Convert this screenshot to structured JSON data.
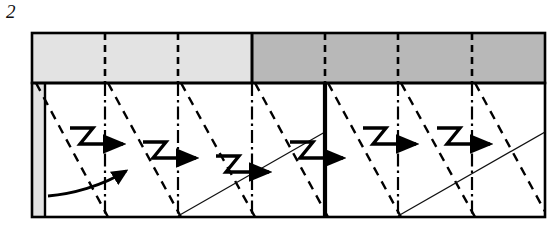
{
  "figure": {
    "label": "2",
    "type": "schematic-diagram"
  },
  "colors": {
    "background": "#ffffff",
    "outline": "#000000",
    "band_light": "#e3e3e3",
    "band_dark": "#b8b8b8",
    "edge_strip": "#e3e3e3",
    "thin_line": "#111111"
  },
  "layout": {
    "frame": {
      "x": 32,
      "y": 33,
      "width": 513,
      "height": 184
    },
    "band": {
      "x": 32,
      "y": 33,
      "width": 513,
      "height": 50
    },
    "field": {
      "x": 32,
      "y": 83,
      "width": 513,
      "height": 134
    },
    "edge_strip": {
      "x": 32,
      "y": 83,
      "width": 13,
      "height": 134
    },
    "band_split_x": 252,
    "thick_divider_x": 325
  },
  "band_segments": [
    {
      "name": "segment-1",
      "x0": 32,
      "x1": 105,
      "shade": "light"
    },
    {
      "name": "segment-2",
      "x0": 105,
      "x1": 178,
      "shade": "light"
    },
    {
      "name": "segment-3",
      "x0": 178,
      "x1": 252,
      "shade": "light"
    },
    {
      "name": "segment-4",
      "x0": 252,
      "x1": 325,
      "shade": "dark"
    },
    {
      "name": "segment-5",
      "x0": 325,
      "x1": 398,
      "shade": "dark"
    },
    {
      "name": "segment-6",
      "x0": 398,
      "x1": 472,
      "shade": "dark"
    },
    {
      "name": "segment-7",
      "x0": 472,
      "x1": 545,
      "shade": "dark"
    }
  ],
  "dash_dot_lines": [
    {
      "name": "dashdot-1",
      "x": 105
    },
    {
      "name": "dashdot-2",
      "x": 178
    },
    {
      "name": "dashdot-3",
      "x": 252
    },
    {
      "name": "dashdot-4",
      "x": 398
    },
    {
      "name": "dashdot-5",
      "x": 472
    }
  ],
  "dashed_diagonals": [
    {
      "name": "diagonal-1",
      "x_top": 36,
      "x_bottom": 108
    },
    {
      "name": "diagonal-2",
      "x_top": 108,
      "x_bottom": 181
    },
    {
      "name": "diagonal-3",
      "x_top": 181,
      "x_bottom": 255
    },
    {
      "name": "diagonal-4",
      "x_top": 255,
      "x_bottom": 328
    },
    {
      "name": "diagonal-5",
      "x_top": 328,
      "x_bottom": 401
    },
    {
      "name": "diagonal-6",
      "x_top": 401,
      "x_bottom": 475
    },
    {
      "name": "diagonal-7",
      "x_top": 475,
      "x_bottom": 545
    }
  ],
  "thin_ascending_lines": [
    {
      "name": "ascending-1",
      "x0": 178,
      "y0": 215,
      "x1": 325,
      "y1": 132
    },
    {
      "name": "ascending-2",
      "x0": 398,
      "y0": 215,
      "x1": 545,
      "y1": 132
    }
  ],
  "step_arrows": [
    {
      "name": "step-arrow-1",
      "x": 70,
      "y": 128
    },
    {
      "name": "step-arrow-2",
      "x": 143,
      "y": 142
    },
    {
      "name": "step-arrow-3",
      "x": 216,
      "y": 156
    },
    {
      "name": "step-arrow-4",
      "x": 290,
      "y": 142
    },
    {
      "name": "step-arrow-5",
      "x": 363,
      "y": 128
    },
    {
      "name": "step-arrow-6",
      "x": 437,
      "y": 128
    }
  ],
  "curved_arrow": {
    "name": "curved-arrow",
    "start_x": 48,
    "start_y": 196,
    "end_x": 134,
    "end_y": 167
  }
}
